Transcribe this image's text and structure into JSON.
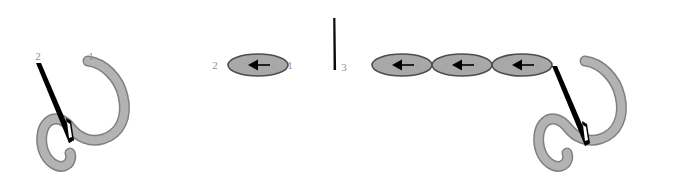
{
  "figure": {
    "width": 691,
    "height": 194,
    "background_color": "#ffffff",
    "type": "technical-line-diagram"
  },
  "colors": {
    "thread_fill": "#b3b3b3",
    "thread_stroke": "#808080",
    "needle_fill": "#000000",
    "ellipse_fill": "#a8a8a8",
    "ellipse_stroke": "#4d4d4d",
    "arrow_fill": "#000000",
    "label_color": "#8f8f8f"
  },
  "panels": [
    {
      "name": "left-panel",
      "description": "Needle passing through curved thread, labeled 2 and 1",
      "labels": [
        {
          "id": "left-label-2",
          "text": "2",
          "x": 38,
          "y": 60
        },
        {
          "id": "left-label-1",
          "text": "1",
          "x": 91,
          "y": 60
        }
      ]
    },
    {
      "name": "middle-panel",
      "description": "Single arrowed ellipse labeled 2 on left and 1 on right, plus vertical needle labeled 3",
      "labels": [
        {
          "id": "mid-label-2",
          "text": "2",
          "x": 215,
          "y": 69
        },
        {
          "id": "mid-label-1",
          "text": "1",
          "x": 287,
          "y": 69
        },
        {
          "id": "mid-label-3",
          "text": "3",
          "x": 341,
          "y": 71
        }
      ],
      "ellipse_count": 1,
      "vertical_needle": {
        "x": 334,
        "y_top": 18,
        "y_bottom": 70
      }
    },
    {
      "name": "right-panel",
      "description": "Chain of three arrowed ellipses attached to needle passing through curved thread",
      "labels": [],
      "ellipse_count": 3
    }
  ],
  "annotations": {
    "label_1": "1",
    "label_2": "2",
    "label_3": "3",
    "arrow_direction": "left"
  }
}
